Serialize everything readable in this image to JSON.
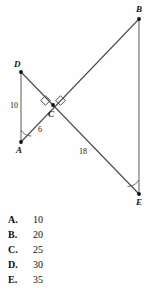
{
  "figure": {
    "points": [
      {
        "name": "D",
        "label": "D",
        "x": 21,
        "y": 72,
        "label_x": 14,
        "label_y": 60
      },
      {
        "name": "A",
        "label": "A",
        "x": 21,
        "y": 142,
        "label_x": 16,
        "label_y": 146
      },
      {
        "name": "B",
        "label": "B",
        "x": 139,
        "y": 19,
        "label_x": 136,
        "label_y": 5
      },
      {
        "name": "E",
        "label": "E",
        "x": 139,
        "y": 194,
        "label_x": 136,
        "label_y": 198
      },
      {
        "name": "C",
        "label": "C",
        "x": 53,
        "y": 105,
        "label_x": 48,
        "label_y": 110
      }
    ],
    "segments": [
      {
        "name": "segment-DA",
        "from": "D",
        "to": "A"
      },
      {
        "name": "segment-BE",
        "from": "B",
        "to": "E"
      },
      {
        "name": "segment-AB",
        "from": "A",
        "to": "B"
      },
      {
        "name": "segment-DE",
        "from": "D",
        "to": "E"
      }
    ],
    "lengths": [
      {
        "name": "length-DA",
        "value": "10",
        "x": 10,
        "y": 102
      },
      {
        "name": "length-AC",
        "value": "6",
        "x": 38,
        "y": 126
      },
      {
        "name": "length-CE",
        "value": "18",
        "x": 79,
        "y": 148
      }
    ],
    "right_angle_marks": [
      {
        "name": "right-angle-mark-left",
        "cx": 46,
        "cy": 101
      },
      {
        "name": "right-angle-mark-right",
        "cx": 60,
        "cy": 101
      }
    ],
    "angle_arcs": [
      {
        "name": "angle-arc-at-A",
        "vertex": "A"
      },
      {
        "name": "angle-arc-at-E",
        "vertex": "E"
      }
    ],
    "stroke_color": "#4a4a4a",
    "vertex_color": "#111111"
  },
  "choices": [
    {
      "letter": "A.",
      "value": "10"
    },
    {
      "letter": "B.",
      "value": "20"
    },
    {
      "letter": "C.",
      "value": "25"
    },
    {
      "letter": "D.",
      "value": "30"
    },
    {
      "letter": "E.",
      "value": "35"
    }
  ]
}
